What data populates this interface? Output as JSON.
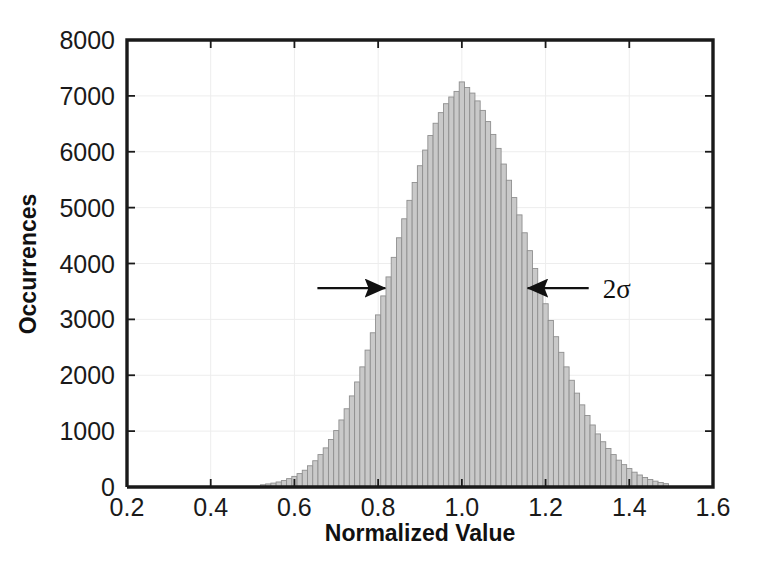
{
  "chart_data": {
    "type": "bar",
    "title": "",
    "subtitle": "",
    "xlabel": "Normalized Value",
    "ylabel": "Occurrences",
    "xlim": [
      0.2,
      1.6
    ],
    "ylim": [
      0,
      8000
    ],
    "xticks": [
      "0.2",
      "0.4",
      "0.6",
      "0.8",
      "1.0",
      "1.2",
      "1.4",
      "1.6"
    ],
    "xtick_values": [
      0.2,
      0.4,
      0.6,
      0.8,
      1.0,
      1.2,
      1.4,
      1.6
    ],
    "yticks": [
      "0",
      "1000",
      "2000",
      "3000",
      "4000",
      "5000",
      "6000",
      "7000",
      "8000"
    ],
    "ytick_values": [
      0,
      1000,
      2000,
      3000,
      4000,
      5000,
      6000,
      7000,
      8000
    ],
    "grid": true,
    "legend": "none",
    "bar_color": "#c9c9c9",
    "bar_edge_color": "#8f8f8f",
    "axis_color": "#1a1a1a",
    "bin_width": 0.0125,
    "distribution": "gaussian",
    "peak_value": 7250,
    "mean": 1.0,
    "sigma": 0.125,
    "x": [
      0.525,
      0.5375,
      0.55,
      0.5625,
      0.575,
      0.5875,
      0.6,
      0.6125,
      0.625,
      0.6375,
      0.65,
      0.6625,
      0.675,
      0.6875,
      0.7,
      0.7125,
      0.725,
      0.7375,
      0.75,
      0.7625,
      0.775,
      0.7875,
      0.8,
      0.8125,
      0.825,
      0.8375,
      0.85,
      0.8625,
      0.875,
      0.8875,
      0.9,
      0.9125,
      0.925,
      0.9375,
      0.95,
      0.9625,
      0.975,
      0.9875,
      1.0,
      1.0125,
      1.025,
      1.0375,
      1.05,
      1.0625,
      1.075,
      1.0875,
      1.1,
      1.1125,
      1.125,
      1.1375,
      1.15,
      1.1625,
      1.175,
      1.1875,
      1.2,
      1.2125,
      1.225,
      1.2375,
      1.25,
      1.2625,
      1.275,
      1.2875,
      1.3,
      1.3125,
      1.325,
      1.3375,
      1.35,
      1.3625,
      1.375,
      1.3875,
      1.4,
      1.4125,
      1.425,
      1.4375,
      1.45,
      1.4625,
      1.475,
      1.4875
    ],
    "values": [
      40,
      55,
      70,
      90,
      115,
      150,
      190,
      240,
      300,
      380,
      470,
      580,
      700,
      850,
      1010,
      1200,
      1400,
      1630,
      1880,
      2150,
      2450,
      2760,
      3080,
      3420,
      3760,
      4110,
      4460,
      4800,
      5130,
      5450,
      5750,
      6030,
      6290,
      6510,
      6700,
      6860,
      6980,
      7080,
      7250,
      7150,
      7050,
      6910,
      6740,
      6540,
      6310,
      6060,
      5780,
      5490,
      5180,
      4870,
      4550,
      4230,
      3910,
      3590,
      3280,
      2980,
      2690,
      2410,
      2150,
      1910,
      1680,
      1470,
      1280,
      1110,
      950,
      810,
      690,
      580,
      480,
      400,
      330,
      265,
      215,
      170,
      135,
      105,
      80,
      60
    ],
    "annotations": [
      {
        "name": "two-sigma-label",
        "text": "2σ",
        "x": 1.37,
        "y": 3560
      },
      {
        "name": "left-arrow",
        "type": "arrow",
        "from_x": 0.655,
        "to_x": 0.817,
        "y": 3560
      },
      {
        "name": "right-arrow",
        "type": "arrow",
        "from_x": 1.303,
        "to_x": 1.157,
        "y": 3560
      }
    ]
  }
}
